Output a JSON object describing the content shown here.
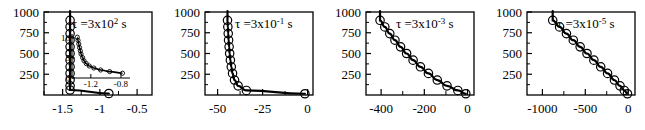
{
  "figure": {
    "panel_count": 4,
    "marker": "open-circle",
    "line_color": "#000000",
    "axis_color": "#000000",
    "background": "#ffffff"
  },
  "chart_data": [
    {
      "type": "line",
      "title": "",
      "annotation": "τ =3x10² s",
      "tau_symbol": "τ",
      "tau_prefix": "=3x10",
      "tau_exponent": "2",
      "tau_unit": "s",
      "xlabel": "",
      "ylabel": "",
      "xlim": [
        -1.75,
        -0.3
      ],
      "ylim": [
        0,
        1000
      ],
      "xticks": [
        -1.5,
        -1.0,
        -0.5
      ],
      "xticklabels": [
        "-1.5",
        "-1",
        "-0.5"
      ],
      "yticks": [
        250,
        500,
        750,
        1000
      ],
      "yticklabels": [
        "250",
        "500",
        "750",
        "1000"
      ],
      "grid": false,
      "legend": "none",
      "x": [
        -1.4,
        -1.4,
        -1.4,
        -1.4,
        -1.4,
        -1.4,
        -1.4,
        -1.4,
        -1.4,
        -1.4,
        -1.4,
        -1.4,
        -0.88
      ],
      "y": [
        900,
        820,
        740,
        660,
        580,
        500,
        420,
        340,
        260,
        180,
        110,
        60,
        18
      ],
      "inset": {
        "type": "line",
        "xlim": [
          -1.45,
          -0.68
        ],
        "ylim": [
          0,
          11
        ],
        "xticks": [
          -1.2,
          -0.8
        ],
        "xticklabels": [
          "-1.2",
          "-0.8"
        ],
        "yticks": [
          0,
          5,
          10
        ],
        "yticklabels": [
          "0",
          "5",
          "10"
        ],
        "x": [
          -1.38,
          -1.37,
          -1.36,
          -1.35,
          -1.34,
          -1.33,
          -1.31,
          -1.29,
          -1.26,
          -1.22,
          -1.16,
          -1.07,
          -0.95,
          -0.78
        ],
        "y": [
          10.2,
          9.4,
          8.5,
          7.6,
          6.8,
          6.0,
          5.1,
          4.3,
          3.6,
          3.0,
          2.5,
          2.0,
          1.6,
          1.2
        ]
      }
    },
    {
      "type": "line",
      "title": "",
      "annotation": "τ =3x10⁻¹ s",
      "tau_symbol": "τ",
      "tau_prefix": "=3x10",
      "tau_exponent": "-1",
      "tau_unit": "s",
      "xlabel": "",
      "ylabel": "",
      "xlim": [
        -57,
        3
      ],
      "ylim": [
        0,
        1000
      ],
      "xticks": [
        -50,
        -25,
        0
      ],
      "xticklabels": [
        "-50",
        "-25",
        "0"
      ],
      "yticks": [
        250,
        500,
        750,
        1000
      ],
      "yticklabels": [
        "250",
        "500",
        "750",
        "1000"
      ],
      "grid": false,
      "legend": "none",
      "x": [
        -44.5,
        -44.3,
        -44.1,
        -43.9,
        -43.6,
        -43.3,
        -42.9,
        -42.4,
        -41.7,
        -40.6,
        -38.6,
        -34.0,
        -1.5
      ],
      "y": [
        900,
        820,
        740,
        660,
        580,
        500,
        420,
        340,
        260,
        180,
        110,
        55,
        15
      ]
    },
    {
      "type": "line",
      "title": "",
      "annotation": "τ =3x10⁻³ s",
      "tau_symbol": "τ",
      "tau_prefix": "=3x10",
      "tau_exponent": "-3",
      "tau_unit": "s",
      "xlabel": "",
      "ylabel": "",
      "xlim": [
        -470,
        30
      ],
      "ylim": [
        0,
        1000
      ],
      "xticks": [
        -400,
        -200,
        0
      ],
      "xticklabels": [
        "-400",
        "-200",
        "0"
      ],
      "yticks": [
        250,
        500,
        750,
        1000
      ],
      "yticklabels": [
        "250",
        "500",
        "750",
        "1000"
      ],
      "grid": false,
      "legend": "none",
      "x": [
        -405,
        -383,
        -360,
        -336,
        -310,
        -282,
        -252,
        -218,
        -181,
        -140,
        -95,
        -45,
        -8
      ],
      "y": [
        900,
        820,
        740,
        660,
        580,
        500,
        420,
        340,
        260,
        180,
        110,
        55,
        15
      ]
    },
    {
      "type": "line",
      "title": "",
      "annotation": "τ =3x10⁻⁵ s",
      "tau_symbol": "τ",
      "tau_prefix": "=3x10",
      "tau_exponent": "-5",
      "tau_unit": "s",
      "xlabel": "",
      "ylabel": "",
      "xlim": [
        -1180,
        80
      ],
      "ylim": [
        0,
        1000
      ],
      "xticks": [
        -1000,
        -500,
        0
      ],
      "xticklabels": [
        "-1000",
        "-500",
        "0"
      ],
      "yticks": [
        250,
        500,
        750,
        1000
      ],
      "yticklabels": [
        "250",
        "500",
        "750",
        "1000"
      ],
      "grid": false,
      "legend": "none",
      "x": [
        -880,
        -800,
        -720,
        -640,
        -560,
        -480,
        -400,
        -320,
        -240,
        -160,
        -95,
        -45,
        -8
      ],
      "y": [
        900,
        820,
        740,
        660,
        580,
        500,
        420,
        340,
        260,
        180,
        110,
        55,
        15
      ]
    }
  ]
}
